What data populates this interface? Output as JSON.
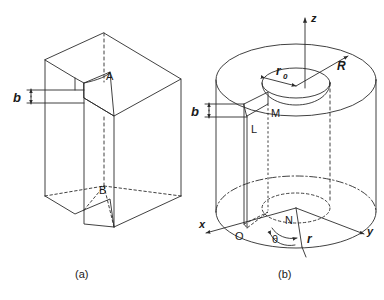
{
  "figure": {
    "background": "#ffffff",
    "line_color": "#2b2b2b",
    "label_color": "#1a1a1a"
  },
  "captions": {
    "a": "(a)",
    "b": "(b)"
  },
  "panel_a": {
    "name": "rectangular-prism-with-slit",
    "labels": {
      "point_top": "A",
      "point_bottom": "B",
      "gap_width": "b"
    }
  },
  "panel_b": {
    "name": "hollow-cylinder-with-radial-slit",
    "labels": {
      "axis_z": "z",
      "axis_x": "x",
      "axis_y": "y",
      "origin": "O",
      "inner_radius": "r",
      "inner_radius_sub": "0",
      "outer_radius": "R",
      "point_l": "L",
      "point_m": "M",
      "point_n": "N",
      "angle": "θ",
      "radius": "r",
      "gap_width": "b"
    }
  }
}
